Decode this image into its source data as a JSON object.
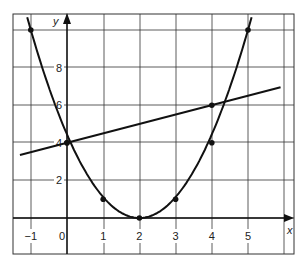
{
  "chart_data": {
    "type": "line",
    "title": "",
    "xlabel": "x",
    "ylabel": "y",
    "xlim": [
      -1.5,
      6.3
    ],
    "ylim": [
      -1,
      10.4
    ],
    "grid": true,
    "x_ticks": [
      -1,
      0,
      1,
      2,
      3,
      4,
      5
    ],
    "x_tick_labels": [
      "−1",
      "0",
      "1",
      "2",
      "3",
      "4",
      "5"
    ],
    "y_ticks": [
      2,
      4,
      6,
      8
    ],
    "y_tick_labels": [
      "2",
      "4",
      "6",
      "8"
    ],
    "series": [
      {
        "name": "parabola",
        "kind": "curve",
        "equation": "y = (x - 2)^2",
        "x_range": [
          -1.1,
          5.1
        ],
        "points": [
          {
            "x": -1,
            "y": 10
          },
          {
            "x": 0,
            "y": 4
          },
          {
            "x": 1,
            "y": 1
          },
          {
            "x": 2,
            "y": 0
          },
          {
            "x": 3,
            "y": 1
          },
          {
            "x": 4,
            "y": 4
          },
          {
            "x": 5,
            "y": 10
          }
        ]
      },
      {
        "name": "straight-line",
        "kind": "line",
        "equation": "y = 0.5x + 4",
        "x_range": [
          -1.3,
          5.9
        ],
        "points": [
          {
            "x": 0,
            "y": 4
          },
          {
            "x": 4,
            "y": 6
          }
        ]
      }
    ]
  },
  "layout": {
    "origin_px": [
      67,
      218
    ],
    "x_unit_px": 36.2,
    "y_unit_px": 18.8,
    "frame": {
      "left": 13,
      "top": 14,
      "right": 294,
      "bottom": 254
    },
    "grid_x_px": [
      31,
      67,
      104,
      140,
      176,
      212,
      248,
      284
    ],
    "grid_y_px": [
      30,
      67,
      105,
      142,
      180,
      218
    ],
    "line_color": "#111111",
    "grid_color": "#333333"
  }
}
